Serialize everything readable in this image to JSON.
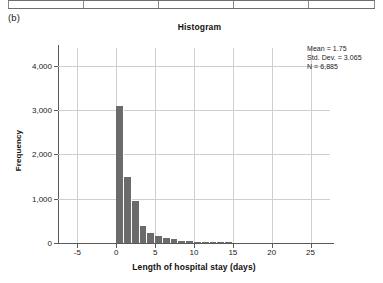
{
  "figure": {
    "panel_label": "(b)",
    "title": "Histogram",
    "width": 383,
    "height": 283
  },
  "table_fragment": {
    "divider_positions": [
      0,
      75,
      150,
      225,
      300,
      366
    ]
  },
  "stats": {
    "mean_label": "Mean = 1.75",
    "std_dev_label": "Std. Dev. = 3.065",
    "n_label": "N = 6,885"
  },
  "colors": {
    "bar": "#6b6b6b",
    "grid": "#cfcfcf",
    "axis": "#5a5a5a",
    "text": "#1a1a1a",
    "background": "#ffffff"
  },
  "chart_data": {
    "type": "bar",
    "title": "Histogram",
    "xlabel": "Length of hospital stay (days)",
    "ylabel": "Frequency",
    "xlim": [
      -7.5,
      27.5
    ],
    "ylim": [
      0,
      4400
    ],
    "grid": true,
    "legend": "none",
    "xticks": [
      -5,
      0,
      5,
      10,
      15,
      20,
      25
    ],
    "xtick_labels": [
      "-5",
      "0",
      "5",
      "10",
      "15",
      "20",
      "25"
    ],
    "yticks": [
      0,
      1000,
      2000,
      3000,
      4000
    ],
    "ytick_labels": [
      "0",
      "1,000",
      "2,000",
      "3,000",
      "4,000"
    ],
    "bin_width": 1,
    "bin_starts": [
      0,
      1,
      2,
      3,
      4,
      5,
      6,
      7,
      8,
      9,
      10,
      11,
      12,
      13,
      14
    ],
    "categories": [
      "0",
      "1",
      "2",
      "3",
      "4",
      "5",
      "6",
      "7",
      "8",
      "9",
      "10",
      "11",
      "12",
      "13",
      "14"
    ],
    "values": [
      3100,
      1500,
      950,
      380,
      230,
      150,
      110,
      80,
      55,
      40,
      30,
      25,
      18,
      12,
      8
    ],
    "annotations": [
      "Mean = 1.75",
      "Std. Dev. = 3.065",
      "N = 6,885"
    ]
  }
}
